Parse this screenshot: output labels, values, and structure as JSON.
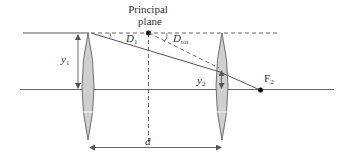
{
  "title": {
    "line1": "Principal",
    "line2": "plane"
  },
  "labels": {
    "y1": "y",
    "y1_sub": "1",
    "y2": "y",
    "y2_sub": "2",
    "D1": "D",
    "D1_sub": "1",
    "Dtot": "D",
    "Dtot_sub": "tot",
    "F2": "F",
    "F2_sub": "2",
    "d": "d"
  },
  "colors": {
    "line": "#555555",
    "lens_fill": "#cfcfcf",
    "text": "#333333"
  }
}
